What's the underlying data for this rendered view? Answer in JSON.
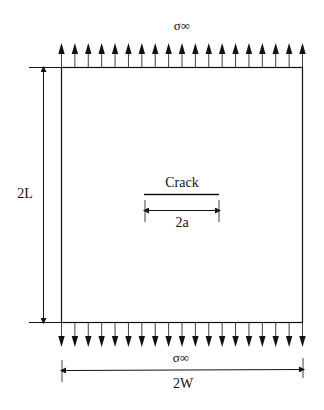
{
  "diagram": {
    "top_stress_label": "σ∞",
    "bottom_stress_label": "σ∞",
    "crack_label": "Crack",
    "crack_length_label": "2a",
    "height_label": "2L",
    "width_label": "2W",
    "arrow_count_top": 19,
    "arrow_count_bottom": 19,
    "line_color": "#111111"
  }
}
